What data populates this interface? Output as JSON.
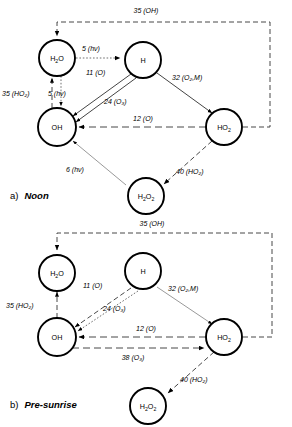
{
  "figure": {
    "panels": [
      {
        "id": "a",
        "caption_index": "a)",
        "caption_text": "Noon",
        "nodes": [
          {
            "id": "h2o",
            "label": "H₂O",
            "base": "H",
            "sub1": "2",
            "rest": "O"
          },
          {
            "id": "h",
            "label": "H",
            "base": "H",
            "sub1": "",
            "rest": ""
          },
          {
            "id": "oh",
            "label": "OH",
            "base": "OH",
            "sub1": "",
            "rest": ""
          },
          {
            "id": "ho2",
            "label": "HO₂",
            "base": "HO",
            "sub1": "2",
            "rest": ""
          },
          {
            "id": "h2o2",
            "label": "H₂O₂",
            "base": "H",
            "sub1": "2",
            "rest": "O"
          }
        ],
        "edges": [
          {
            "from": "ho2",
            "to": "h2o",
            "value": "35",
            "species": "(OH)",
            "label": "35  (OH)",
            "style": "dashed"
          },
          {
            "from": "h2o",
            "to": "h",
            "value": "5",
            "species": "(hν)",
            "label": "5 (hν)",
            "style": "dotted"
          },
          {
            "from": "h",
            "to": "oh",
            "value": "11",
            "species": "(O)",
            "label": "11 (O)",
            "style": "solid"
          },
          {
            "from": "h2o",
            "to": "oh",
            "value": "5",
            "species": "(hν)",
            "label": "5 (hν)",
            "style": "dotted"
          },
          {
            "from": "oh",
            "to": "h2o",
            "value": "35",
            "species": "(HO₂)",
            "label": "35 (HO₂)",
            "style": "dashed"
          },
          {
            "from": "h",
            "to": "ho2",
            "value": "32",
            "species": "(O₂,M)",
            "label": "32 (O₂,M)",
            "style": "solid"
          },
          {
            "from": "h",
            "to": "oh",
            "value": "24",
            "species": "(O₃)",
            "label": "24 (O₃)",
            "style": "solid"
          },
          {
            "from": "ho2",
            "to": "oh",
            "value": "12",
            "species": "(O)",
            "label": "12 (O)",
            "style": "dashlong"
          },
          {
            "from": "h2o2",
            "to": "oh",
            "value": "6",
            "species": "(hν)",
            "label": "6 (hν)",
            "style": "thin"
          },
          {
            "from": "ho2",
            "to": "h2o2",
            "value": "40",
            "species": "(HO₂)",
            "label": "40 (HO₂)",
            "style": "dashed"
          }
        ]
      },
      {
        "id": "b",
        "caption_index": "b)",
        "caption_text": "Pre-sunrise",
        "nodes": [
          {
            "id": "h2o",
            "label": "H₂O",
            "base": "H",
            "sub1": "2",
            "rest": "O"
          },
          {
            "id": "h",
            "label": "H",
            "base": "H",
            "sub1": "",
            "rest": ""
          },
          {
            "id": "oh",
            "label": "OH",
            "base": "OH",
            "sub1": "",
            "rest": ""
          },
          {
            "id": "ho2",
            "label": "HO₂",
            "base": "HO",
            "sub1": "2",
            "rest": ""
          },
          {
            "id": "h2o2",
            "label": "H₂O₂",
            "base": "H",
            "sub1": "2",
            "rest": "O"
          }
        ],
        "edges": [
          {
            "from": "ho2",
            "to": "h2o",
            "value": "35",
            "species": "(OH)",
            "label": "35 (OH)",
            "style": "dashed"
          },
          {
            "from": "oh",
            "to": "h2o",
            "value": "35",
            "species": "(HO₂)",
            "label": "35 (HO₂)",
            "style": "dashed"
          },
          {
            "from": "h",
            "to": "oh",
            "value": "11",
            "species": "(O)",
            "label": "11 (O)",
            "style": "dashed"
          },
          {
            "from": "h",
            "to": "ho2",
            "value": "32",
            "species": "(O₂,M)",
            "label": "32 (O₂,M)",
            "style": "thin"
          },
          {
            "from": "h",
            "to": "oh",
            "value": "24",
            "species": "(O₃)",
            "label": "24 (O₃)",
            "style": "dotted"
          },
          {
            "from": "ho2",
            "to": "oh",
            "value": "12",
            "species": "(O)",
            "label": "12 (O)",
            "style": "dashlong"
          },
          {
            "from": "oh",
            "to": "ho2",
            "value": "38",
            "species": "(O₃)",
            "label": "38 (O₃)",
            "style": "dashlong"
          },
          {
            "from": "ho2",
            "to": "h2o2",
            "value": "40",
            "species": "(HO₂)",
            "label": "40 (HO₂)",
            "style": "dashed"
          }
        ]
      }
    ]
  },
  "labels": {
    "a": {
      "top_loop": "35  (OH)",
      "h2o_to_h": "5 (hν)",
      "h_to_oh_11": "11 (O)",
      "h2o_to_oh": "5 (hν)",
      "oh_to_h2o": "35 (HO₂)",
      "h_to_ho2": "32 (O₂,M)",
      "h_to_oh_24": "24 (O₃)",
      "ho2_to_oh": "12 (O)",
      "h2o2_to_oh": "6 (hν)",
      "ho2_to_h2o2": "40 (HO₂)"
    },
    "b": {
      "top_loop": "35 (OH)",
      "oh_to_h2o": "35 (HO₂)",
      "h_to_oh_11": "11 (O)",
      "h_to_ho2": "32 (O₂,M)",
      "h_to_oh_24": "24 (O₃)",
      "ho2_to_oh": "12 (O)",
      "oh_to_ho2": "38 (O₃)",
      "ho2_to_h2o2": "40 (HO₂)"
    }
  }
}
